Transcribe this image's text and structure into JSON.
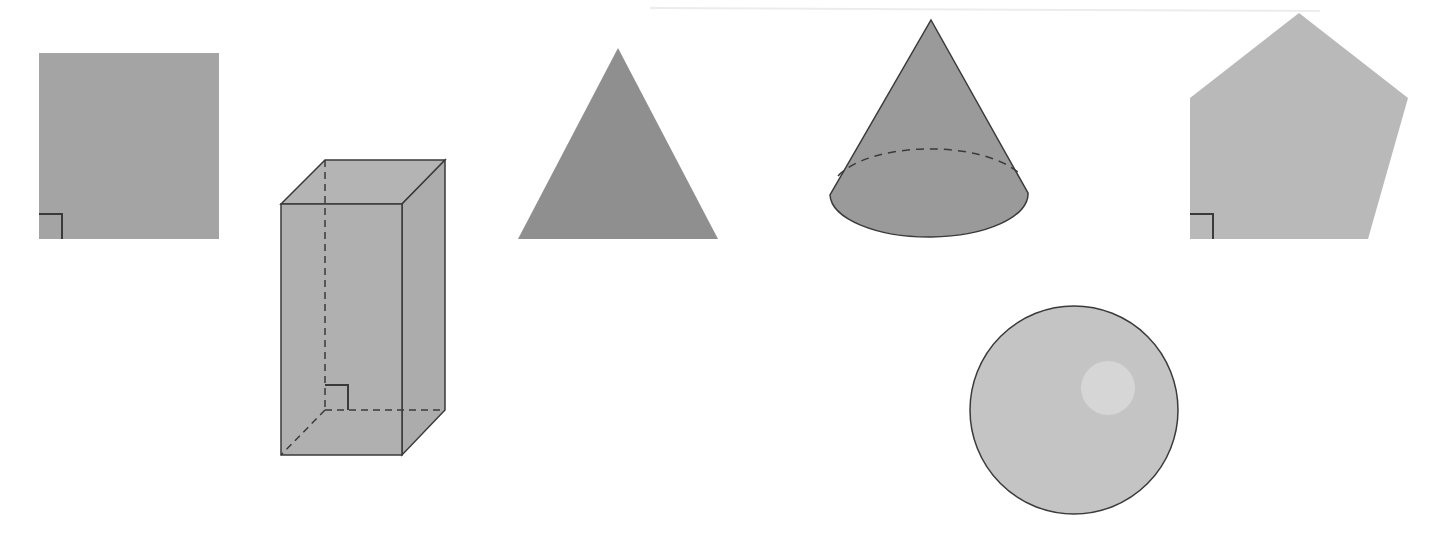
{
  "figure": {
    "title": "Geometric shapes",
    "width": 1438,
    "height": 545,
    "background": "#ffffff"
  },
  "colors": {
    "stroke": "#3a3a3a",
    "square_fill": "#a4a4a4",
    "prism_fill": "#b0b0b0",
    "prism_top_fill": "#b4b4b4",
    "prism_side_fill": "#acacac",
    "triangle_fill": "#8f8f8f",
    "cone_fill": "#9a9a9a",
    "pentagon_fill": "#b9b9b9",
    "sphere_fill": "#c4c4c4",
    "sphere_highlight": "#d6d6d6",
    "scan_line": "#ececec"
  },
  "shapes": [
    {
      "id": "square",
      "label": "Square",
      "type": "2d",
      "right_angle_marker": true
    },
    {
      "id": "rectangular-prism",
      "label": "Rectangular prism",
      "type": "3d",
      "right_angle_marker": true
    },
    {
      "id": "triangle",
      "label": "Triangle",
      "type": "2d",
      "right_angle_marker": false
    },
    {
      "id": "cone",
      "label": "Cone",
      "type": "3d",
      "right_angle_marker": false
    },
    {
      "id": "pentagon",
      "label": "Pentagon",
      "type": "2d",
      "right_angle_marker": true
    },
    {
      "id": "sphere",
      "label": "Sphere",
      "type": "3d",
      "right_angle_marker": false
    }
  ]
}
